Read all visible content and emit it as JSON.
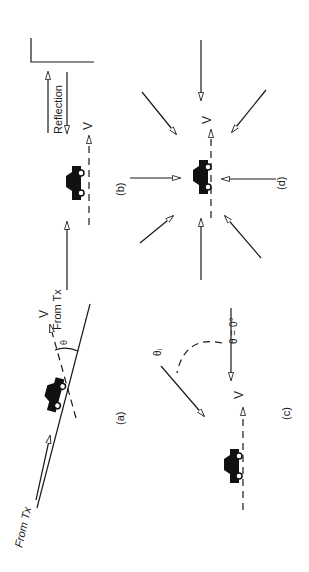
{
  "figure": {
    "orientation": "rotated 90 degrees counter-clockwise",
    "panels": [
      {
        "id": "a",
        "label": "(a)",
        "description": "Car moving at angle theta relative to wave from transmitter",
        "labels": {
          "source": "From Tx",
          "velocity": "V",
          "angle": "θ"
        }
      },
      {
        "id": "b",
        "label": "(b)",
        "description": "Car with direct wave from transmitter and reflection from wall",
        "labels": {
          "source": "From Tx",
          "velocity": "V",
          "reflection": "Reflection"
        }
      },
      {
        "id": "c",
        "label": "(c)",
        "description": "Car with wave arriving at theta = 0 and at arbitrary angle theta_i",
        "labels": {
          "velocity": "V",
          "angle_zero": "θ = 0°",
          "angle_i": "θᵢ"
        }
      },
      {
        "id": "d",
        "label": "(d)",
        "description": "Car with waves arriving uniformly from all directions",
        "labels": {
          "velocity": "V"
        }
      }
    ]
  }
}
